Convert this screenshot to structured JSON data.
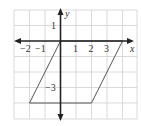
{
  "figure": {
    "type": "coordinate-grid",
    "axes": {
      "x_label": "x",
      "y_label": "y"
    },
    "x_ticks": [
      "−2",
      "−1",
      "1",
      "2",
      "3"
    ],
    "y_ticks": [
      "1",
      "−3"
    ],
    "x_range": [
      -3,
      5
    ],
    "y_range": [
      -5,
      2
    ],
    "shape": {
      "kind": "parallelogram",
      "vertices": [
        [
          0,
          0
        ],
        [
          4,
          0
        ],
        [
          2,
          -4
        ],
        [
          -2,
          -4
        ]
      ]
    },
    "colors": {
      "grid": "#d0d0d0",
      "axis": "#222222",
      "shape": "#555555"
    }
  }
}
